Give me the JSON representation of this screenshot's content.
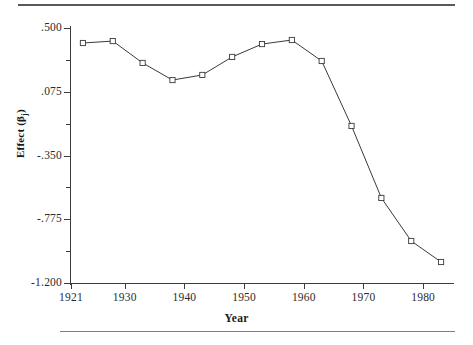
{
  "figure": {
    "axis_title_x": "Year",
    "axis_title_y_main": "Effect (β",
    "axis_title_y_sub": "j",
    "axis_title_y_close": ")",
    "line_color": "#3a3a3a",
    "marker_color": "#ffffff",
    "marker_edge_color": "#3a3a3a",
    "rule_color": "#555a5e"
  },
  "chart_data": {
    "type": "line",
    "title": "",
    "subtitle": "",
    "xlabel": "Year",
    "ylabel": "Effect (βj)",
    "xlim": [
      1921,
      1985
    ],
    "ylim": [
      -1.2,
      0.5
    ],
    "grid": false,
    "legend": false,
    "legend_position": "none",
    "x_tick_labels": [
      "1921",
      "1930",
      "1940",
      "1950",
      "1960",
      "1970",
      "1980"
    ],
    "x_ticks": [
      1921,
      1930,
      1940,
      1950,
      1960,
      1970,
      1980
    ],
    "y_tick_labels": [
      ".500",
      ".075",
      "-.350",
      "-.775",
      "-1.200"
    ],
    "y_ticks": [
      0.5,
      0.075,
      -0.35,
      -0.775,
      -1.2
    ],
    "y_minor_ticks": [
      0.2875,
      -0.1375,
      -0.5625,
      -0.9875
    ],
    "marker": "open-square",
    "series": [
      {
        "name": "Effect",
        "x": [
          1923,
          1928,
          1933,
          1938,
          1943,
          1948,
          1953,
          1958,
          1963,
          1968,
          1973,
          1978,
          1983
        ],
        "values": [
          0.4,
          0.413,
          0.267,
          0.153,
          0.187,
          0.307,
          0.393,
          0.42,
          0.28,
          -0.153,
          -0.633,
          -0.92,
          -1.06
        ]
      }
    ],
    "annotations": []
  }
}
